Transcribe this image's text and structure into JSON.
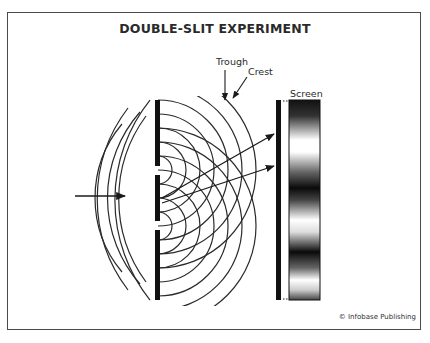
{
  "title": "DOUBLE-SLIT EXPERIMENT",
  "labels": {
    "trough": "Trough",
    "crest": "Crest",
    "screen": "Screen"
  },
  "credit": "© Infobase Publishing",
  "colors": {
    "ink": "#2a2a2a",
    "frame": "#4a4a4a",
    "background": "#ffffff"
  },
  "elements": {
    "incident_arrow": "arrow pointing right toward barrier",
    "barrier": "barrier with two slits",
    "diffraction_waves": "semicircular wavefronts emerging from each slit",
    "path_arrows": "two arrows from slits to screen",
    "screen_pattern": "interference pattern of alternating bright and dark bands"
  }
}
